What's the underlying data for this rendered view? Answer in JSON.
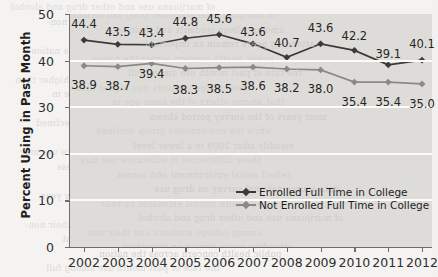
{
  "chart_data": {
    "type": "line",
    "title": "",
    "xlabel": "",
    "ylabel": "Percent Using in Past Month",
    "categories": [
      "2002",
      "2003",
      "2004",
      "2005",
      "2006",
      "2007",
      "2008",
      "2009",
      "2010",
      "2011",
      "2012"
    ],
    "x": [
      2002,
      2003,
      2004,
      2005,
      2006,
      2007,
      2008,
      2009,
      2010,
      2011,
      2012
    ],
    "ylim": [
      0,
      50
    ],
    "yticks": [
      0,
      10,
      20,
      30,
      40,
      50
    ],
    "ytick_labels": [
      "0",
      "10",
      "20",
      "30",
      "40",
      "50"
    ],
    "grid": "horizontal-white",
    "legend_position": "inside-lower-right",
    "series": [
      {
        "name": "Enrolled Full Time in College",
        "color": "#3b3a38",
        "marker": "diamond",
        "values": [
          44.4,
          43.5,
          43.4,
          44.8,
          45.6,
          43.6,
          40.7,
          43.6,
          42.2,
          39.1,
          40.1
        ],
        "labels": [
          "44.4",
          "43.5",
          "43.4",
          "44.8",
          "45.6",
          "43.6",
          "40.7",
          "43.6",
          "42.2",
          "39.1",
          "40.1"
        ]
      },
      {
        "name": "Not Enrolled Full Time in College",
        "color": "#8b8986",
        "marker": "diamond",
        "values": [
          38.9,
          38.7,
          39.4,
          38.3,
          38.5,
          38.6,
          38.2,
          38.0,
          35.4,
          35.4,
          35.0
        ],
        "labels": [
          "38.9",
          "38.7",
          "39.4",
          "38.3",
          "38.5",
          "38.6",
          "38.2",
          "38.0",
          "35.4",
          "35.4",
          "35.0"
        ]
      }
    ]
  },
  "legend": {
    "items": [
      {
        "label": "Enrolled Full Time in College",
        "color": "#3b3a38"
      },
      {
        "label": "Not Enrolled Full Time in College",
        "color": "#8b8986"
      }
    ]
  },
  "axes": {
    "y_title": "Percent Using in Past Month"
  },
  "background": {
    "plot_fill": "#dedcd9",
    "page_fill": "#f4f3f1",
    "gridline_color": "#fbfbfa",
    "axis_color": "#6e6c6a"
  },
  "bleed_text": [
    "of marijuana use and other drug and alcohol",
    "among college students and their non-",
    "attending peers remain an important",
    "public health concern across the nation",
    "the rate of past month use among full",
    "time college students was higher than",
    "that among others of the same age in",
    "most years of the survey period shown",
    "while the non-enrolled group declined",
    "steadily after 2009 to a lower level",
    "these differences in substance use may",
    "reflect social environment and access",
    "data source national survey on drug use",
    "and health annual estimates by year"
  ]
}
